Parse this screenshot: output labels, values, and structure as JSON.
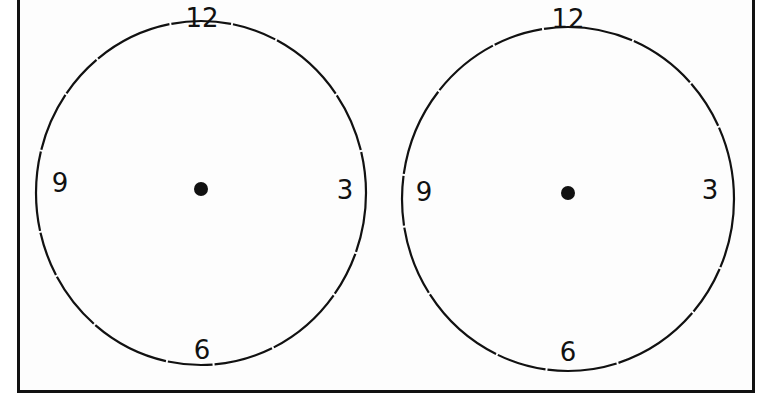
{
  "worksheet": {
    "colors": {
      "ink": "#111111",
      "paper": "#fdfdfd"
    },
    "clocks": [
      {
        "id": "clock-left",
        "center": [
          201,
          189
        ],
        "radius": [
          165,
          172
        ],
        "labels": {
          "twelve": "12",
          "three": "3",
          "six": "6",
          "nine": "9"
        },
        "hands": []
      },
      {
        "id": "clock-right",
        "center": [
          568,
          192
        ],
        "radius": [
          166,
          172
        ],
        "labels": {
          "twelve": "12",
          "three": "3",
          "six": "6",
          "nine": "9"
        },
        "hands": []
      }
    ]
  }
}
